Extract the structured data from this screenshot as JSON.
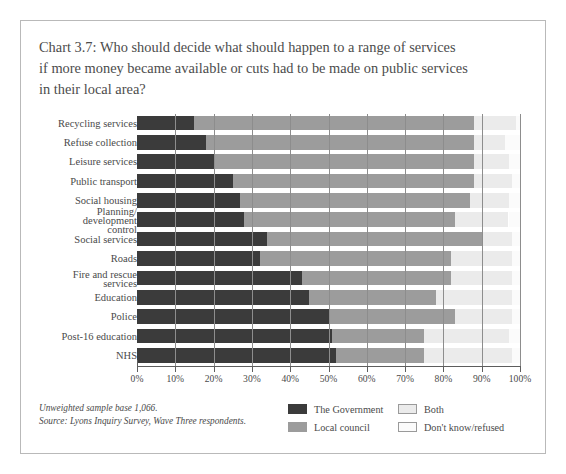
{
  "figure": {
    "title_lines": [
      "Chart 3.7: Who should decide what should happen to a range of services",
      "if more money became available or cuts had to be made on public services",
      "in their local area?"
    ],
    "footnotes": [
      "Unweighted sample base 1,066.",
      "Source: Lyons Inquiry Survey, Wave Three respondents."
    ]
  },
  "colors": {
    "government": "#3b3b3b",
    "local_council": "#9c9c9c",
    "both": "#ebebeb",
    "dont_know": "#fbfbfb",
    "axis": "#5d5d5d",
    "text": "#4a4a4a",
    "border": "#b9b9b9"
  },
  "legend": {
    "position": "bottom-right",
    "entries": [
      {
        "label": "The Government",
        "color": "#3b3b3b",
        "swatch": "sw-gov"
      },
      {
        "label": "Local council",
        "color": "#9c9c9c",
        "swatch": "sw-council"
      },
      {
        "label": "Both",
        "color": "#ebebeb",
        "swatch": "sw-both"
      },
      {
        "label": "Don't know/refused",
        "color": "#fbfbfb",
        "swatch": "sw-dk"
      }
    ]
  },
  "chart_data": {
    "type": "bar",
    "orientation": "horizontal",
    "stacked": true,
    "stack_mode": "percent",
    "title": "Chart 3.7: Who should decide what should happen to a range of services if more money became available or cuts had to be made on public services in their local area?",
    "xlabel": "",
    "ylabel": "",
    "xlim": [
      0,
      100
    ],
    "xticks": [
      0,
      10,
      20,
      30,
      40,
      50,
      60,
      70,
      80,
      90,
      100
    ],
    "xticklabels": [
      "0%",
      "10%",
      "20%",
      "30%",
      "40%",
      "50%",
      "60%",
      "70%",
      "80%",
      "90%",
      "100%"
    ],
    "grid": true,
    "grid_axis": "x",
    "legend_entries": [
      "The Government",
      "Local council",
      "Both",
      "Don't know/refused"
    ],
    "categories": [
      "Recycling services",
      "Refuse collection",
      "Leisure services",
      "Public transport",
      "Social housing",
      "Planning/ development control",
      "Social services",
      "Roads",
      "Fire and rescue services",
      "Education",
      "Police",
      "Post-16 education",
      "NHS"
    ],
    "series": [
      {
        "name": "The Government",
        "values": [
          15,
          18,
          20,
          25,
          27,
          28,
          34,
          32,
          43,
          45,
          50,
          51,
          52
        ]
      },
      {
        "name": "Local council",
        "values": [
          73,
          70,
          68,
          63,
          60,
          55,
          56,
          50,
          39,
          33,
          33,
          24,
          23
        ]
      },
      {
        "name": "Both",
        "values": [
          11,
          8,
          9,
          10,
          10,
          14,
          8,
          16,
          16,
          20,
          15,
          22,
          23
        ]
      },
      {
        "name": "Don't know/refused",
        "values": [
          1,
          4,
          3,
          2,
          3,
          3,
          2,
          2,
          2,
          2,
          2,
          3,
          2
        ]
      }
    ],
    "annotations": [
      "Unweighted sample base 1,066.",
      "Source: Lyons Inquiry Survey, Wave Three respondents."
    ]
  },
  "rows": [
    {
      "label": "Recycling services",
      "label_lines": [
        "Recycling services"
      ],
      "gov": 15,
      "council": 73,
      "both": 11,
      "dk": 1
    },
    {
      "label": "Refuse collection",
      "label_lines": [
        "Refuse collection"
      ],
      "gov": 18,
      "council": 70,
      "both": 8,
      "dk": 4
    },
    {
      "label": "Leisure services",
      "label_lines": [
        "Leisure services"
      ],
      "gov": 20,
      "council": 68,
      "both": 9,
      "dk": 3
    },
    {
      "label": "Public transport",
      "label_lines": [
        "Public transport"
      ],
      "gov": 25,
      "council": 63,
      "both": 10,
      "dk": 2
    },
    {
      "label": "Social housing",
      "label_lines": [
        "Social housing"
      ],
      "gov": 27,
      "council": 60,
      "both": 10,
      "dk": 3
    },
    {
      "label": "Planning/ development control",
      "label_lines": [
        "Planning/",
        "development",
        "control"
      ],
      "gov": 28,
      "council": 55,
      "both": 14,
      "dk": 3
    },
    {
      "label": "Social services",
      "label_lines": [
        "Social services"
      ],
      "gov": 34,
      "council": 56,
      "both": 8,
      "dk": 2
    },
    {
      "label": "Roads",
      "label_lines": [
        "Roads"
      ],
      "gov": 32,
      "council": 50,
      "both": 16,
      "dk": 2
    },
    {
      "label": "Fire and rescue services",
      "label_lines": [
        "Fire and rescue",
        "services"
      ],
      "gov": 43,
      "council": 39,
      "both": 16,
      "dk": 2
    },
    {
      "label": "Education",
      "label_lines": [
        "Education"
      ],
      "gov": 45,
      "council": 33,
      "both": 20,
      "dk": 2
    },
    {
      "label": "Police",
      "label_lines": [
        "Police"
      ],
      "gov": 50,
      "council": 33,
      "both": 15,
      "dk": 2
    },
    {
      "label": "Post-16 education",
      "label_lines": [
        "Post-16 education"
      ],
      "gov": 51,
      "council": 24,
      "both": 22,
      "dk": 3
    },
    {
      "label": "NHS",
      "label_lines": [
        "NHS"
      ],
      "gov": 52,
      "council": 23,
      "both": 23,
      "dk": 2
    }
  ]
}
